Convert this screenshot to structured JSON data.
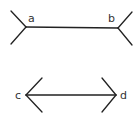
{
  "diagram": {
    "stroke_color": "#222222",
    "label_color": "#333333",
    "figures": [
      {
        "name": "fins-out",
        "labels": {
          "left": "a",
          "right": "b"
        },
        "shaft": {
          "x1": 26,
          "y1": 27,
          "x2": 118,
          "y2": 28
        },
        "fins": [
          {
            "x1": 11,
            "y1": 11,
            "x2": 26,
            "y2": 27
          },
          {
            "x1": 11,
            "y1": 44,
            "x2": 26,
            "y2": 27
          },
          {
            "x1": 132,
            "y1": 12,
            "x2": 118,
            "y2": 28
          },
          {
            "x1": 132,
            "y1": 45,
            "x2": 118,
            "y2": 28
          }
        ]
      },
      {
        "name": "fins-in",
        "labels": {
          "left": "c",
          "right": "d"
        },
        "shaft": {
          "x1": 26,
          "y1": 95,
          "x2": 116,
          "y2": 95
        },
        "fins": [
          {
            "x1": 42,
            "y1": 78,
            "x2": 26,
            "y2": 95
          },
          {
            "x1": 42,
            "y1": 112,
            "x2": 26,
            "y2": 95
          },
          {
            "x1": 102,
            "y1": 78,
            "x2": 116,
            "y2": 95
          },
          {
            "x1": 102,
            "y1": 112,
            "x2": 116,
            "y2": 95
          }
        ]
      }
    ]
  }
}
